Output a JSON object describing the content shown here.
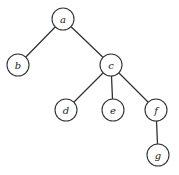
{
  "diagram": {
    "type": "tree",
    "nodes": [
      {
        "id": "a",
        "label": "a",
        "x": 63,
        "y": 19
      },
      {
        "id": "b",
        "label": "b",
        "x": 18,
        "y": 65
      },
      {
        "id": "c",
        "label": "c",
        "x": 111,
        "y": 65
      },
      {
        "id": "d",
        "label": "d",
        "x": 66,
        "y": 110
      },
      {
        "id": "e",
        "label": "e",
        "x": 113,
        "y": 110
      },
      {
        "id": "f",
        "label": "f",
        "x": 156,
        "y": 110
      },
      {
        "id": "g",
        "label": "g",
        "x": 158,
        "y": 155
      }
    ],
    "edges": [
      {
        "from": "a",
        "to": "b"
      },
      {
        "from": "a",
        "to": "c"
      },
      {
        "from": "c",
        "to": "d"
      },
      {
        "from": "c",
        "to": "e"
      },
      {
        "from": "c",
        "to": "f"
      },
      {
        "from": "f",
        "to": "g"
      }
    ]
  }
}
